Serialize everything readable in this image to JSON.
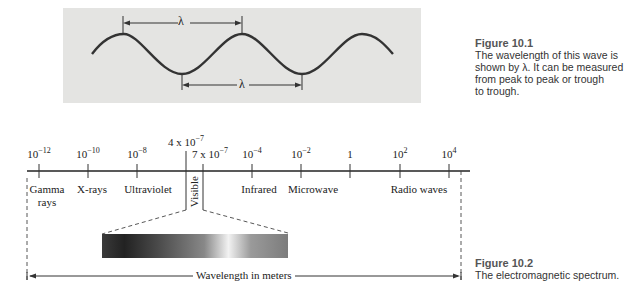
{
  "figure_10_1": {
    "wave_symbol_top": "λ",
    "wave_symbol_bottom": "λ",
    "caption_title": "Figure 10.1",
    "caption_lines": [
      "The wavelength of this wave is",
      "shown by λ. It can be measured",
      "from peak to peak or trough",
      "to trough."
    ],
    "colors": {
      "box_bg": "#e4e4e2",
      "wave": "#333333",
      "caption_title": "#555555"
    }
  },
  "figure_10_2": {
    "ticks": [
      {
        "base": "10",
        "exp": "−12"
      },
      {
        "base": "10",
        "exp": "−10"
      },
      {
        "base": "10",
        "exp": "−8"
      },
      {
        "base": "10",
        "exp": "−4"
      },
      {
        "base": "10",
        "exp": "−2"
      },
      {
        "base": "1",
        "exp": ""
      },
      {
        "base": "10",
        "exp": "2"
      },
      {
        "base": "10",
        "exp": "4"
      }
    ],
    "visible_start": {
      "base": "4 x 10",
      "exp": "−7"
    },
    "visible_end": {
      "base": "7 x 10",
      "exp": "−7"
    },
    "bands": [
      "Gamma",
      "rays",
      "X-rays",
      "Ultraviolet",
      "Visible",
      "Infrared",
      "Microwave",
      "Radio waves"
    ],
    "axis_label": "Wavelength in meters",
    "caption_title": "Figure 10.2",
    "caption_text": "The electromagnetic spectrum."
  }
}
